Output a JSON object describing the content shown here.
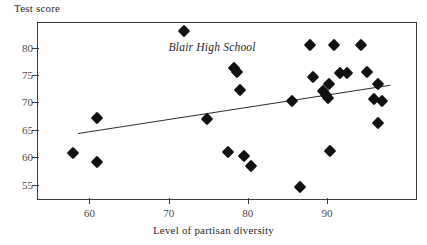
{
  "chart_data": {
    "type": "scatter",
    "title": "",
    "xlabel": "Level of partisan diversity",
    "ylabel": "Test score",
    "xlim": [
      53.5,
      101.5
    ],
    "ylim": [
      52.0,
      84.5
    ],
    "xticks": [
      60,
      70,
      80,
      90
    ],
    "yticks": [
      55,
      60,
      65,
      70,
      75,
      80
    ],
    "grid": false,
    "legend": "none",
    "marker": "filled-diamond",
    "marker_color": "#111111",
    "points": [
      {
        "x": 57.9,
        "y": 60.8
      },
      {
        "x": 61.0,
        "y": 67.1
      },
      {
        "x": 61.0,
        "y": 59.2
      },
      {
        "x": 72.0,
        "y": 83.0
      },
      {
        "x": 74.8,
        "y": 66.9
      },
      {
        "x": 77.5,
        "y": 61.0
      },
      {
        "x": 78.3,
        "y": 76.3
      },
      {
        "x": 78.6,
        "y": 75.6
      },
      {
        "x": 79.0,
        "y": 72.3
      },
      {
        "x": 79.5,
        "y": 60.2
      },
      {
        "x": 80.4,
        "y": 58.3
      },
      {
        "x": 85.6,
        "y": 70.3
      },
      {
        "x": 86.6,
        "y": 54.5
      },
      {
        "x": 87.8,
        "y": 80.4
      },
      {
        "x": 88.2,
        "y": 74.6
      },
      {
        "x": 89.5,
        "y": 72.0
      },
      {
        "x": 89.9,
        "y": 71.4
      },
      {
        "x": 90.1,
        "y": 70.8
      },
      {
        "x": 90.3,
        "y": 73.3
      },
      {
        "x": 90.4,
        "y": 61.2
      },
      {
        "x": 90.9,
        "y": 80.4
      },
      {
        "x": 91.6,
        "y": 75.3
      },
      {
        "x": 92.5,
        "y": 75.3
      },
      {
        "x": 94.3,
        "y": 80.5
      },
      {
        "x": 95.0,
        "y": 75.5
      },
      {
        "x": 96.5,
        "y": 73.4
      },
      {
        "x": 96.0,
        "y": 70.6
      },
      {
        "x": 97.0,
        "y": 70.2
      },
      {
        "x": 96.5,
        "y": 66.2
      }
    ],
    "trendline": {
      "x_start": 58.5,
      "y_start": 64.4,
      "x_end": 98.0,
      "y_end": 73.2
    },
    "annotations": [
      {
        "text": "Blair High School",
        "x": 75.5,
        "y": 80.2,
        "style": "italic"
      }
    ]
  }
}
